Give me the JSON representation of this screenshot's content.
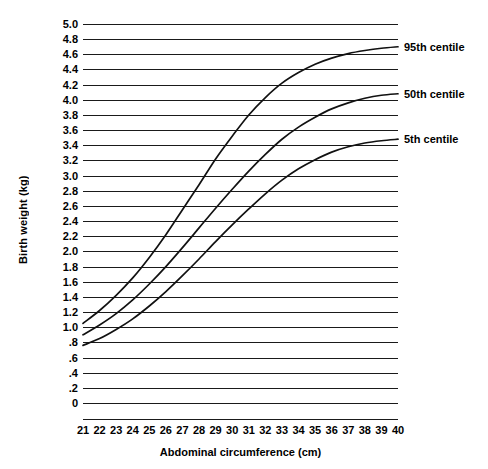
{
  "chart_data": {
    "type": "line",
    "title": "",
    "xlabel": "Abdominal circumference (cm)",
    "ylabel": "Birth weight (kg)",
    "xlim": [
      21,
      40
    ],
    "ylim": [
      0,
      5.0
    ],
    "grid": true,
    "legend_position": "right-inline-annotations",
    "x": [
      21,
      22,
      23,
      24,
      25,
      26,
      27,
      28,
      29,
      30,
      31,
      32,
      33,
      34,
      35,
      36,
      37,
      38,
      39,
      40
    ],
    "xticklabels": [
      "21",
      "22",
      "23",
      "24",
      "25",
      "26",
      "27",
      "28",
      "29",
      "30",
      "31",
      "32",
      "33",
      "34",
      "35",
      "36",
      "37",
      "38",
      "39",
      "40"
    ],
    "yticks": [
      0,
      0.2,
      0.4,
      0.6,
      0.8,
      1.0,
      1.2,
      1.4,
      1.6,
      1.8,
      2.0,
      2.2,
      2.4,
      2.6,
      2.8,
      3.0,
      3.2,
      3.4,
      3.6,
      3.8,
      4.0,
      4.2,
      4.4,
      4.6,
      4.8,
      5.0
    ],
    "yticklabels": [
      "0",
      ".2",
      ".4",
      ".6",
      ".8",
      "1.0",
      "1.2",
      "1.4",
      "1.6",
      "1.8",
      "2.0",
      "2.2",
      "2.4",
      "2.6",
      "2.8",
      "3.0",
      "3.2",
      "3.4",
      "3.6",
      "3.8",
      "4.0",
      "4.2",
      "4.4",
      "4.6",
      "4.8",
      "5.0"
    ],
    "series": [
      {
        "name": "95th centile",
        "label": "95th centile",
        "color": "#111111",
        "values": [
          1.05,
          1.22,
          1.42,
          1.65,
          1.92,
          2.22,
          2.55,
          2.88,
          3.22,
          3.52,
          3.8,
          4.03,
          4.22,
          4.36,
          4.47,
          4.55,
          4.61,
          4.65,
          4.68,
          4.7
        ]
      },
      {
        "name": "50th centile",
        "label": "50th centile",
        "color": "#111111",
        "values": [
          0.9,
          1.03,
          1.18,
          1.36,
          1.57,
          1.8,
          2.05,
          2.31,
          2.57,
          2.82,
          3.06,
          3.28,
          3.48,
          3.64,
          3.77,
          3.88,
          3.96,
          4.02,
          4.06,
          4.08
        ]
      },
      {
        "name": "5th centile",
        "label": "5th centile",
        "color": "#111111",
        "values": [
          0.76,
          0.85,
          0.97,
          1.11,
          1.28,
          1.47,
          1.68,
          1.9,
          2.13,
          2.35,
          2.56,
          2.76,
          2.94,
          3.09,
          3.21,
          3.31,
          3.38,
          3.43,
          3.46,
          3.48
        ]
      }
    ],
    "annotations": [
      {
        "text": "95th centile",
        "at_x": 40,
        "at_y": 4.7
      },
      {
        "text": "50th centile",
        "at_x": 40,
        "at_y": 4.08
      },
      {
        "text": "5th centile",
        "at_x": 40,
        "at_y": 3.48
      }
    ]
  }
}
